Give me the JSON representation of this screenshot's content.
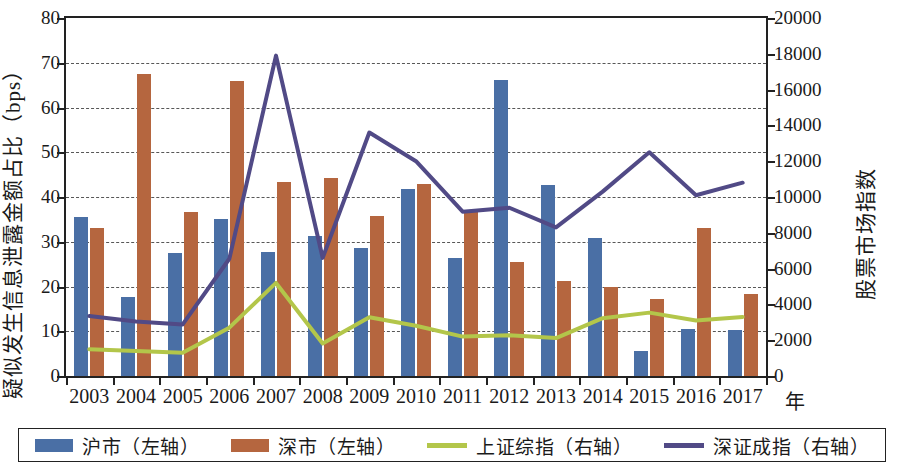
{
  "chart_data": {
    "type": "bar",
    "title": "",
    "xlabel": "年",
    "categories": [
      "2003",
      "2004",
      "2005",
      "2006",
      "2007",
      "2008",
      "2009",
      "2010",
      "2011",
      "2012",
      "2013",
      "2014",
      "2015",
      "2016",
      "2017"
    ],
    "axes": {
      "left": {
        "label": "疑似发生信息泄露金额占比（bps）",
        "ylim": [
          0,
          80
        ],
        "ticks": [
          0,
          10,
          20,
          30,
          40,
          50,
          60,
          70,
          80
        ],
        "tick_labels": [
          "0",
          "10",
          "20",
          "30",
          "40",
          "50",
          "60",
          "70",
          "80"
        ]
      },
      "right": {
        "label": "股票市场指数",
        "ylim": [
          0,
          20000
        ],
        "ticks": [
          0,
          2000,
          4000,
          6000,
          8000,
          10000,
          12000,
          14000,
          16000,
          18000,
          20000
        ],
        "tick_labels": [
          "0",
          "2000",
          "4000",
          "6000",
          "8000",
          "10000",
          "12000",
          "14000",
          "16000",
          "18000",
          "20000"
        ]
      }
    },
    "grid": true,
    "legend_position": "bottom",
    "series": [
      {
        "name": "沪市（左轴）",
        "type": "bar",
        "axis": "left",
        "color": "#4a6fa5",
        "values": [
          35.6,
          17.7,
          27.4,
          35.1,
          27.7,
          31.3,
          28.6,
          41.9,
          26.3,
          66.1,
          42.7,
          30.8,
          5.7,
          10.5,
          10.2
        ]
      },
      {
        "name": "深市（左轴）",
        "type": "bar",
        "axis": "left",
        "color": "#b5663f",
        "values": [
          33.0,
          67.5,
          36.7,
          66.0,
          43.3,
          44.2,
          35.8,
          43.0,
          36.8,
          25.4,
          21.2,
          19.8,
          17.3,
          33.0,
          18.4
        ]
      },
      {
        "name": "上证综指（右轴）",
        "type": "line",
        "axis": "right",
        "color": "#b3c64a",
        "values": [
          1500,
          1400,
          1300,
          2700,
          5200,
          1820,
          3280,
          2810,
          2200,
          2270,
          2120,
          3230,
          3540,
          3100,
          3300
        ]
      },
      {
        "name": "深证成指（右轴）",
        "type": "line",
        "axis": "right",
        "color": "#514a86",
        "values": [
          3350,
          3050,
          2880,
          6550,
          17900,
          6600,
          13600,
          12000,
          9180,
          9400,
          8300,
          10300,
          12500,
          10100,
          10800
        ]
      }
    ]
  },
  "legend": {
    "items": [
      {
        "label": "沪市（左轴）",
        "marker": "bar",
        "color": "#4a6fa5"
      },
      {
        "label": "深市（左轴）",
        "marker": "bar",
        "color": "#b5663f"
      },
      {
        "label": "上证综指（右轴）",
        "marker": "line",
        "color": "#b3c64a"
      },
      {
        "label": "深证成指（右轴）",
        "marker": "line",
        "color": "#514a86"
      }
    ]
  }
}
